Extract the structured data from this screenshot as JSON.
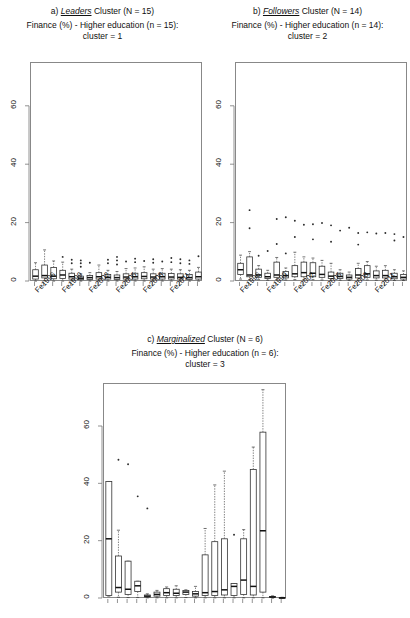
{
  "figure": {
    "panels": [
      {
        "tag": "a)",
        "cluster_name": "Leaders",
        "cluster_word": "Cluster",
        "n_label": "(N = 15)",
        "title_full": "a) Leaders Cluster (N = 15)",
        "subtitle_line1": "Finance (%) - Higher education (n = 15):",
        "subtitle_line2": "cluster = 1"
      },
      {
        "tag": "b)",
        "cluster_name": "Followers",
        "cluster_word": "Cluster",
        "n_label": "(N = 14)",
        "title_full": "b) Followers Cluster (N = 14)",
        "subtitle_line1": "Finance (%) - Higher education (n = 14):",
        "subtitle_line2": "cluster = 2"
      },
      {
        "tag": "c)",
        "cluster_name": "Marginalized",
        "cluster_word": "Cluster",
        "n_label": "(N = 6)",
        "title_full": "c) Marginalized Cluster (N = 6)",
        "subtitle_line1": "Finance (%) - Higher education (n = 6):",
        "subtitle_line2": "cluster = 3"
      }
    ]
  },
  "chart_data": [
    {
      "id": "panel-a",
      "type": "box",
      "title": "a) Leaders Cluster (N = 15)",
      "subtitle": "Finance (%) - Higher education (n = 15): cluster = 1",
      "xlabel": "",
      "ylabel": "",
      "ylim": [
        0,
        75
      ],
      "yticks": [
        0,
        20,
        40,
        60
      ],
      "ytick_labels": [
        "0",
        "20",
        "40",
        "60"
      ],
      "grid": false,
      "legend": "none",
      "categories": [
        "Fe1996",
        "Fe1997",
        "Fe1998",
        "Fe1999",
        "Fe2000",
        "Fe2001",
        "Fe2002",
        "Fe2003",
        "Fe2004",
        "Fe2005",
        "Fe2006",
        "Fe2007",
        "Fe2008",
        "Fe2009",
        "Fe2010",
        "Fe2011",
        "Fe2012",
        "Fe2013",
        "Fe2014"
      ],
      "xtick_labels_shown": [
        "Fe1996",
        "Fe1999",
        "Fe2002",
        "Fe2005",
        "Fe2008",
        "Fe2011"
      ],
      "boxes": [
        {
          "x": "Fe1996",
          "min": 0.3,
          "q1": 1.0,
          "median": 2.0,
          "q3": 4.2,
          "max": 6.6,
          "outliers": []
        },
        {
          "x": "Fe1997",
          "min": 0.4,
          "q1": 1.4,
          "median": 2.2,
          "q3": 5.8,
          "max": 11.0,
          "outliers": []
        },
        {
          "x": "Fe1998",
          "min": 0.3,
          "q1": 1.1,
          "median": 2.0,
          "q3": 5.0,
          "max": 7.2,
          "outliers": []
        },
        {
          "x": "Fe1999",
          "min": 0.3,
          "q1": 1.2,
          "median": 2.4,
          "q3": 4.0,
          "max": 6.8,
          "outliers": [
            8.6
          ]
        },
        {
          "x": "Fe2000",
          "min": 0.4,
          "q1": 1.0,
          "median": 1.8,
          "q3": 3.0,
          "max": 4.4,
          "outliers": [
            6.4,
            7.6
          ]
        },
        {
          "x": "Fe2001",
          "min": 0.3,
          "q1": 0.8,
          "median": 1.3,
          "q3": 2.0,
          "max": 2.8,
          "outliers": [
            5.2,
            6.4,
            7.4
          ]
        },
        {
          "x": "Fe2002",
          "min": 0.3,
          "q1": 0.9,
          "median": 1.5,
          "q3": 2.2,
          "max": 3.2,
          "outliers": [
            6.6
          ]
        },
        {
          "x": "Fe2003",
          "min": 0.4,
          "q1": 1.0,
          "median": 1.8,
          "q3": 3.2,
          "max": 5.8,
          "outliers": []
        },
        {
          "x": "Fe2004",
          "min": 0.3,
          "q1": 1.0,
          "median": 1.6,
          "q3": 2.6,
          "max": 4.0,
          "outliers": [
            6.4,
            7.6
          ]
        },
        {
          "x": "Fe2005",
          "min": 0.3,
          "q1": 0.9,
          "median": 1.5,
          "q3": 2.4,
          "max": 3.6,
          "outliers": [
            6.0,
            7.4,
            8.6
          ]
        },
        {
          "x": "Fe2006",
          "min": 0.3,
          "q1": 1.0,
          "median": 1.7,
          "q3": 2.8,
          "max": 4.6,
          "outliers": [
            7.0
          ]
        },
        {
          "x": "Fe2007",
          "min": 0.3,
          "q1": 1.0,
          "median": 1.8,
          "q3": 3.0,
          "max": 4.8,
          "outliers": [
            6.8,
            8.0
          ]
        },
        {
          "x": "Fe2008",
          "min": 0.3,
          "q1": 1.1,
          "median": 1.9,
          "q3": 3.2,
          "max": 5.2,
          "outliers": [
            7.2
          ]
        },
        {
          "x": "Fe2009",
          "min": 0.3,
          "q1": 1.0,
          "median": 1.7,
          "q3": 2.8,
          "max": 4.4,
          "outliers": [
            6.6,
            7.8
          ]
        },
        {
          "x": "Fe2010",
          "min": 0.3,
          "q1": 1.0,
          "median": 1.8,
          "q3": 3.0,
          "max": 4.6,
          "outliers": [
            7.0
          ]
        },
        {
          "x": "Fe2011",
          "min": 0.3,
          "q1": 1.0,
          "median": 1.7,
          "q3": 2.9,
          "max": 4.4,
          "outliers": [
            6.8,
            8.2
          ]
        },
        {
          "x": "Fe2012",
          "min": 0.3,
          "q1": 1.0,
          "median": 1.6,
          "q3": 2.8,
          "max": 4.2,
          "outliers": [
            6.4,
            7.8
          ]
        },
        {
          "x": "Fe2013",
          "min": 0.3,
          "q1": 0.9,
          "median": 1.5,
          "q3": 2.6,
          "max": 4.0,
          "outliers": [
            6.2,
            7.4
          ]
        },
        {
          "x": "Fe2014",
          "min": 0.3,
          "q1": 1.0,
          "median": 1.8,
          "q3": 3.4,
          "max": 5.0,
          "outliers": [
            8.8
          ]
        }
      ]
    },
    {
      "id": "panel-b",
      "type": "box",
      "title": "b) Followers Cluster (N = 14)",
      "subtitle": "Finance (%) - Higher education (n = 14): cluster = 2",
      "xlabel": "",
      "ylabel": "",
      "ylim": [
        0,
        75
      ],
      "yticks": [
        0,
        20,
        40,
        60
      ],
      "ytick_labels": [
        "0",
        "20",
        "40",
        "60"
      ],
      "grid": false,
      "legend": "none",
      "categories": [
        "Fe1996",
        "Fe1997",
        "Fe1998",
        "Fe1999",
        "Fe2000",
        "Fe2001",
        "Fe2002",
        "Fe2003",
        "Fe2004",
        "Fe2005",
        "Fe2006",
        "Fe2007",
        "Fe2008",
        "Fe2009",
        "Fe2010",
        "Fe2011",
        "Fe2012",
        "Fe2013",
        "Fe2014"
      ],
      "xtick_labels_shown": [
        "Fe1996",
        "Fe1999",
        "Fe2002",
        "Fe2005",
        "Fe2008",
        "Fe2011"
      ],
      "boxes": [
        {
          "x": "Fe1996",
          "min": 1.0,
          "q1": 2.6,
          "median": 4.2,
          "q3": 6.4,
          "max": 9.2,
          "outliers": []
        },
        {
          "x": "Fe1997",
          "min": 0.8,
          "q1": 1.8,
          "median": 2.4,
          "q3": 8.6,
          "max": 10.4,
          "outliers": [
            24.6,
            18.4
          ]
        },
        {
          "x": "Fe1998",
          "min": 0.8,
          "q1": 1.6,
          "median": 2.4,
          "q3": 4.4,
          "max": 5.6,
          "outliers": [
            9.0
          ]
        },
        {
          "x": "Fe1999",
          "min": 0.6,
          "q1": 1.2,
          "median": 1.8,
          "q3": 3.0,
          "max": 4.0,
          "outliers": [
            10.6
          ]
        },
        {
          "x": "Fe2000",
          "min": 0.8,
          "q1": 1.6,
          "median": 2.4,
          "q3": 6.8,
          "max": 8.4,
          "outliers": [
            21.6,
            13.0
          ]
        },
        {
          "x": "Fe2001",
          "min": 0.7,
          "q1": 1.4,
          "median": 2.2,
          "q3": 3.6,
          "max": 4.8,
          "outliers": [
            22.2,
            9.8
          ]
        },
        {
          "x": "Fe2002",
          "min": 0.8,
          "q1": 1.8,
          "median": 2.8,
          "q3": 5.6,
          "max": 10.2,
          "outliers": [
            21.0,
            15.4
          ]
        },
        {
          "x": "Fe2003",
          "min": 0.8,
          "q1": 1.8,
          "median": 3.2,
          "q3": 6.8,
          "max": 8.6,
          "outliers": [
            19.6
          ]
        },
        {
          "x": "Fe2004",
          "min": 0.8,
          "q1": 1.8,
          "median": 3.0,
          "q3": 6.6,
          "max": 8.2,
          "outliers": [
            19.8,
            14.6
          ]
        },
        {
          "x": "Fe2005",
          "min": 0.7,
          "q1": 1.6,
          "median": 2.6,
          "q3": 5.4,
          "max": 7.4,
          "outliers": [
            20.2
          ]
        },
        {
          "x": "Fe2006",
          "min": 0.6,
          "q1": 1.2,
          "median": 2.0,
          "q3": 3.4,
          "max": 6.4,
          "outliers": [
            19.4,
            13.8
          ]
        },
        {
          "x": "Fe2007",
          "min": 0.6,
          "q1": 1.2,
          "median": 1.9,
          "q3": 3.0,
          "max": 4.2,
          "outliers": [
            17.6
          ]
        },
        {
          "x": "Fe2008",
          "min": 0.5,
          "q1": 1.0,
          "median": 1.6,
          "q3": 2.4,
          "max": 3.4,
          "outliers": [
            18.6
          ]
        },
        {
          "x": "Fe2009",
          "min": 0.6,
          "q1": 1.4,
          "median": 2.4,
          "q3": 4.6,
          "max": 6.4,
          "outliers": [
            16.8,
            12.8
          ]
        },
        {
          "x": "Fe2010",
          "min": 0.7,
          "q1": 1.6,
          "median": 2.8,
          "q3": 5.6,
          "max": 7.0,
          "outliers": [
            17.0
          ]
        },
        {
          "x": "Fe2011",
          "min": 0.6,
          "q1": 1.4,
          "median": 2.2,
          "q3": 3.8,
          "max": 5.4,
          "outliers": [
            16.6
          ]
        },
        {
          "x": "Fe2012",
          "min": 0.6,
          "q1": 1.4,
          "median": 2.2,
          "q3": 4.0,
          "max": 5.6,
          "outliers": [
            16.8
          ]
        },
        {
          "x": "Fe2013",
          "min": 0.5,
          "q1": 1.1,
          "median": 1.8,
          "q3": 3.0,
          "max": 4.2,
          "outliers": [
            16.4,
            14.2
          ]
        },
        {
          "x": "Fe2014",
          "min": 0.5,
          "q1": 1.0,
          "median": 1.6,
          "q3": 2.6,
          "max": 3.8,
          "outliers": [
            15.4
          ]
        }
      ]
    },
    {
      "id": "panel-c",
      "type": "box",
      "title": "c) Marginalized Cluster (N = 6)",
      "subtitle": "Finance (%) - Higher education (n = 6): cluster = 3",
      "xlabel": "",
      "ylabel": "",
      "ylim": [
        0,
        75
      ],
      "yticks": [
        0,
        20,
        40,
        60
      ],
      "ytick_labels": [
        "0",
        "20",
        "40",
        "60"
      ],
      "grid": false,
      "legend": "none",
      "categories": [
        "Fe1996",
        "Fe1997",
        "Fe1998",
        "Fe1999",
        "Fe2000",
        "Fe2001",
        "Fe2002",
        "Fe2003",
        "Fe2004",
        "Fe2005",
        "Fe2006",
        "Fe2007",
        "Fe2008",
        "Fe2009",
        "Fe2010",
        "Fe2011",
        "Fe2012",
        "Fe2013",
        "Fe2014"
      ],
      "xtick_labels_shown": [],
      "boxes": [
        {
          "x": "Fe1996",
          "min": 1.0,
          "q1": 1.2,
          "median": 21.0,
          "q3": 41.0,
          "max": 41.0,
          "outliers": []
        },
        {
          "x": "Fe1997",
          "min": 0.6,
          "q1": 2.4,
          "median": 4.0,
          "q3": 15.0,
          "max": 24.0,
          "outliers": [
            48.6
          ]
        },
        {
          "x": "Fe1998",
          "min": 0.5,
          "q1": 1.6,
          "median": 3.4,
          "q3": 13.2,
          "max": 13.2,
          "outliers": [
            47.0
          ]
        },
        {
          "x": "Fe1999",
          "min": 0.5,
          "q1": 2.6,
          "median": 4.6,
          "q3": 6.2,
          "max": 6.2,
          "outliers": [
            35.8
          ]
        },
        {
          "x": "Fe2000",
          "min": 0.4,
          "q1": 0.7,
          "median": 1.0,
          "q3": 1.4,
          "max": 1.8,
          "outliers": [
            31.6
          ]
        },
        {
          "x": "Fe2001",
          "min": 0.4,
          "q1": 1.0,
          "median": 1.6,
          "q3": 2.4,
          "max": 3.0,
          "outliers": []
        },
        {
          "x": "Fe2002",
          "min": 0.4,
          "q1": 1.2,
          "median": 2.2,
          "q3": 3.6,
          "max": 4.2,
          "outliers": []
        },
        {
          "x": "Fe2003",
          "min": 0.4,
          "q1": 1.2,
          "median": 2.0,
          "q3": 3.4,
          "max": 4.6,
          "outliers": []
        },
        {
          "x": "Fe2004",
          "min": 0.5,
          "q1": 1.6,
          "median": 2.4,
          "q3": 3.0,
          "max": 3.2,
          "outliers": []
        },
        {
          "x": "Fe2005",
          "min": 0.4,
          "q1": 1.0,
          "median": 1.8,
          "q3": 2.6,
          "max": 4.4,
          "outliers": []
        },
        {
          "x": "Fe2006",
          "min": 0.4,
          "q1": 1.2,
          "median": 2.2,
          "q3": 15.4,
          "max": 24.6,
          "outliers": []
        },
        {
          "x": "Fe2007",
          "min": 0.4,
          "q1": 1.2,
          "median": 2.6,
          "q3": 20.0,
          "max": 39.8,
          "outliers": []
        },
        {
          "x": "Fe2008",
          "min": 0.4,
          "q1": 1.4,
          "median": 3.2,
          "q3": 21.0,
          "max": 44.6,
          "outliers": []
        },
        {
          "x": "Fe2009",
          "min": 0.4,
          "q1": 1.2,
          "median": 4.4,
          "q3": 5.4,
          "max": 5.4,
          "outliers": [
            22.4
          ]
        },
        {
          "x": "Fe2010",
          "min": 0.4,
          "q1": 1.6,
          "median": 6.6,
          "q3": 21.0,
          "max": 24.2,
          "outliers": []
        },
        {
          "x": "Fe2011",
          "min": 0.4,
          "q1": 1.4,
          "median": 4.4,
          "q3": 45.2,
          "max": 53.0,
          "outliers": []
        },
        {
          "x": "Fe2012",
          "min": 0.4,
          "q1": 2.4,
          "median": 23.8,
          "q3": 58.2,
          "max": 73.0,
          "outliers": []
        },
        {
          "x": "Fe2013",
          "min": 0.3,
          "q1": 0.5,
          "median": 0.7,
          "q3": 0.9,
          "max": 1.1,
          "outliers": []
        },
        {
          "x": "Fe2014",
          "min": 0.2,
          "q1": 0.3,
          "median": 0.4,
          "q3": 0.5,
          "max": 0.6,
          "outliers": []
        }
      ]
    }
  ]
}
